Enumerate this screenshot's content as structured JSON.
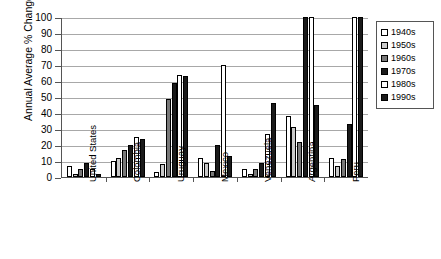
{
  "chart_data": {
    "type": "bar",
    "title": "",
    "xlabel": "",
    "ylabel": "Annual Average % Change",
    "ylim": [
      0,
      100
    ],
    "ytick_step": 10,
    "yticks": [
      100,
      90,
      80,
      70,
      60,
      50,
      40,
      30,
      20,
      10,
      0
    ],
    "grid": true,
    "legend_position": "right",
    "categories": [
      "United States",
      "Colombia",
      "Uruguay",
      "Mexico",
      "Venezuela",
      "Argentina",
      "Peru"
    ],
    "series": [
      {
        "name": "1940s",
        "color": "#ffffff",
        "values": [
          7,
          10,
          3,
          12,
          5,
          38,
          12
        ]
      },
      {
        "name": "1950s",
        "color": "#c9c9c9",
        "values": [
          2,
          12,
          8,
          9,
          2,
          31,
          7
        ]
      },
      {
        "name": "1960s",
        "color": "#787878",
        "values": [
          5,
          17,
          49,
          4,
          5,
          22,
          11
        ]
      },
      {
        "name": "1970s",
        "color": "#1a1a1a",
        "values": [
          9,
          20,
          59,
          20,
          9,
          100,
          33
        ]
      },
      {
        "name": "1980s",
        "color": "#ffffff",
        "values": [
          5,
          25,
          64,
          70,
          27,
          100,
          100
        ]
      },
      {
        "name": "1990s",
        "color": "#1a1a1a",
        "values": [
          2,
          24,
          63,
          13,
          46,
          45,
          100
        ]
      }
    ],
    "clipped_at_max": [
      {
        "category": "Argentina",
        "series": "1970s"
      },
      {
        "category": "Argentina",
        "series": "1980s"
      },
      {
        "category": "Peru",
        "series": "1980s"
      },
      {
        "category": "Peru",
        "series": "1990s"
      }
    ]
  },
  "axis": {
    "y_title": "Annual Average % Change"
  },
  "legend": {
    "entries": [
      {
        "label": "1940s"
      },
      {
        "label": "1950s"
      },
      {
        "label": "1960s"
      },
      {
        "label": "1970s"
      },
      {
        "label": "1980s"
      },
      {
        "label": "1990s"
      }
    ]
  }
}
